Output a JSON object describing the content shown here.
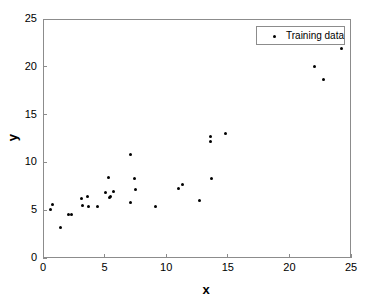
{
  "chart_data": {
    "type": "scatter",
    "title": "",
    "xlabel": "x",
    "ylabel": "y",
    "xlim": [
      0,
      25
    ],
    "ylim": [
      0,
      25
    ],
    "xticks": [
      0,
      5,
      10,
      15,
      20,
      25
    ],
    "yticks": [
      0,
      5,
      10,
      15,
      20,
      25
    ],
    "grid": false,
    "legend": {
      "position": "top-right",
      "entries": [
        {
          "label": "Training data",
          "marker": "dot",
          "color": "#000000"
        }
      ]
    },
    "series": [
      {
        "name": "Training data",
        "marker": "dot",
        "color": "#000000",
        "points": [
          {
            "x": 0.6,
            "y": 5.1
          },
          {
            "x": 0.8,
            "y": 5.6
          },
          {
            "x": 1.4,
            "y": 3.2
          },
          {
            "x": 2.1,
            "y": 4.6
          },
          {
            "x": 2.3,
            "y": 4.6
          },
          {
            "x": 3.1,
            "y": 6.2
          },
          {
            "x": 3.2,
            "y": 5.5
          },
          {
            "x": 3.6,
            "y": 6.4
          },
          {
            "x": 3.7,
            "y": 5.4
          },
          {
            "x": 4.4,
            "y": 5.4
          },
          {
            "x": 5.1,
            "y": 6.9
          },
          {
            "x": 5.3,
            "y": 8.4
          },
          {
            "x": 5.4,
            "y": 6.3
          },
          {
            "x": 5.5,
            "y": 6.4
          },
          {
            "x": 5.7,
            "y": 7.0
          },
          {
            "x": 7.1,
            "y": 10.8
          },
          {
            "x": 7.1,
            "y": 5.8
          },
          {
            "x": 7.4,
            "y": 8.3
          },
          {
            "x": 7.5,
            "y": 7.2
          },
          {
            "x": 9.1,
            "y": 5.4
          },
          {
            "x": 11.0,
            "y": 7.3
          },
          {
            "x": 11.3,
            "y": 7.7
          },
          {
            "x": 12.7,
            "y": 6.0
          },
          {
            "x": 13.6,
            "y": 12.7
          },
          {
            "x": 13.6,
            "y": 12.2
          },
          {
            "x": 13.7,
            "y": 8.3
          },
          {
            "x": 14.8,
            "y": 13.0
          },
          {
            "x": 22.0,
            "y": 20.0
          },
          {
            "x": 22.8,
            "y": 18.7
          },
          {
            "x": 24.2,
            "y": 21.9
          }
        ]
      }
    ]
  },
  "axes": {
    "xticklabels": [
      "0",
      "5",
      "10",
      "15",
      "20",
      "25"
    ],
    "yticklabels": [
      "0",
      "5",
      "10",
      "15",
      "20",
      "25"
    ],
    "xlabel": "x",
    "ylabel": "y"
  },
  "legend": {
    "label": "Training data"
  },
  "colors": {
    "marker": "#000000",
    "axis": "#8c8c8c",
    "background": "#ffffff",
    "text": "#000000"
  }
}
